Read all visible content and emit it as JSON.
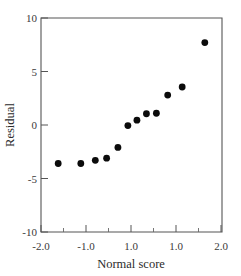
{
  "chart_data": {
    "type": "scatter",
    "title": "",
    "xlabel": "Normal score",
    "ylabel": "Residual",
    "xlim": [
      -2.0,
      2.0
    ],
    "ylim": [
      -10,
      10
    ],
    "xticks": [
      -2.0,
      -1.0,
      0.0,
      1.0,
      2.0
    ],
    "xticklabels": [
      "-2.0",
      "-1.0",
      "1.0",
      "1.0",
      "2.0"
    ],
    "yticks": [
      -10,
      -5,
      0,
      5,
      10
    ],
    "yticklabels": [
      "-10",
      "-5",
      "0",
      "5",
      "10"
    ],
    "x_minor_ticks": [
      -1.5,
      -0.5,
      0.5,
      1.5
    ],
    "grid": false,
    "legend": null,
    "marker": "filled-circle",
    "marker_color": "#0b0b0b",
    "marker_size_px": 3.4,
    "points": [
      {
        "x": -1.62,
        "y": -3.6
      },
      {
        "x": -1.12,
        "y": -3.6
      },
      {
        "x": -0.8,
        "y": -3.3
      },
      {
        "x": -0.55,
        "y": -3.1
      },
      {
        "x": -0.3,
        "y": -2.1
      },
      {
        "x": -0.08,
        "y": -0.05
      },
      {
        "x": 0.12,
        "y": 0.45
      },
      {
        "x": 0.33,
        "y": 1.05
      },
      {
        "x": 0.55,
        "y": 1.1
      },
      {
        "x": 0.8,
        "y": 2.8
      },
      {
        "x": 1.12,
        "y": 3.55
      },
      {
        "x": 1.62,
        "y": 7.7
      }
    ],
    "n_points": 12,
    "axis_color": "#555555",
    "background_color": "#ffffff"
  },
  "figure": {
    "plot_left_px": 41,
    "plot_right_px": 222,
    "plot_top_px": 18,
    "plot_bottom_px": 232
  }
}
